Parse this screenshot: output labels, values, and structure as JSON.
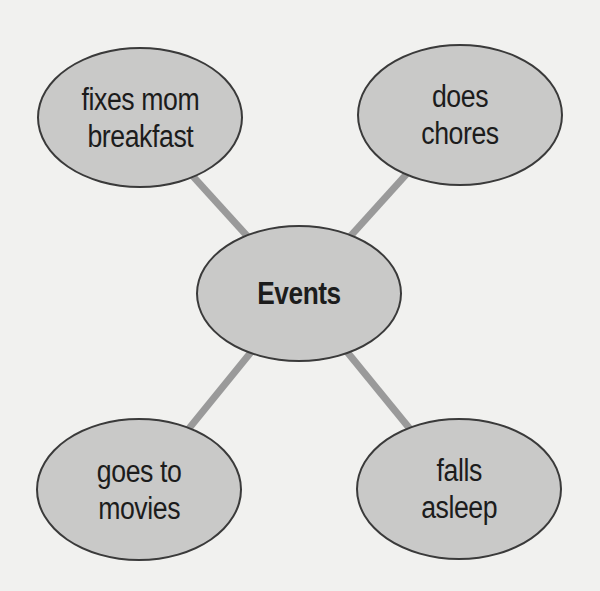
{
  "diagram": {
    "type": "web",
    "colors": {
      "background": "#f1f1ef",
      "node_fill": "#c9c9c8",
      "node_border": "#3a3a3a",
      "connector": "#9a9a9a",
      "text": "#1c1c1c"
    },
    "center": {
      "label": "Events"
    },
    "nodes": [
      {
        "position": "top-left",
        "lines": [
          "fixes mom",
          "breakfast"
        ]
      },
      {
        "position": "top-right",
        "lines": [
          "does",
          "chores"
        ]
      },
      {
        "position": "bottom-left",
        "lines": [
          "goes to",
          "movies"
        ]
      },
      {
        "position": "bottom-right",
        "lines": [
          "falls",
          "asleep"
        ]
      }
    ]
  }
}
